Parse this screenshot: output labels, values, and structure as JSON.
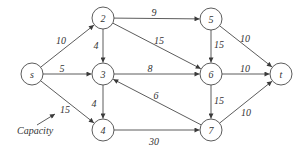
{
  "diagram": {
    "type": "flow-network",
    "colors": {
      "stroke": "#4a4a4a",
      "text": "#333333",
      "background": "#ffffff"
    },
    "node_radius": 11,
    "nodes": [
      {
        "id": "s",
        "label": "s",
        "x": 32,
        "y": 74
      },
      {
        "id": "2",
        "label": "2",
        "x": 103,
        "y": 18
      },
      {
        "id": "3",
        "label": "3",
        "x": 103,
        "y": 74
      },
      {
        "id": "4",
        "label": "4",
        "x": 103,
        "y": 130
      },
      {
        "id": "5",
        "label": "5",
        "x": 211,
        "y": 19
      },
      {
        "id": "6",
        "label": "6",
        "x": 211,
        "y": 74
      },
      {
        "id": "7",
        "label": "7",
        "x": 211,
        "y": 130
      },
      {
        "id": "t",
        "label": "t",
        "x": 281,
        "y": 74
      }
    ],
    "edges": [
      {
        "from": "s",
        "to": "2",
        "capacity": "10",
        "lx": 61,
        "ly": 40
      },
      {
        "from": "s",
        "to": "3",
        "capacity": "5",
        "lx": 62,
        "ly": 68
      },
      {
        "from": "s",
        "to": "4",
        "capacity": "15",
        "lx": 65,
        "ly": 109
      },
      {
        "from": "2",
        "to": "3",
        "capacity": "4",
        "lx": 96,
        "ly": 45
      },
      {
        "from": "2",
        "to": "5",
        "capacity": "9",
        "lx": 154,
        "ly": 12
      },
      {
        "from": "2",
        "to": "6",
        "capacity": "15",
        "lx": 159,
        "ly": 40
      },
      {
        "from": "3",
        "to": "4",
        "capacity": "4",
        "lx": 94,
        "ly": 103
      },
      {
        "from": "3",
        "to": "6",
        "capacity": "8",
        "lx": 150,
        "ly": 68
      },
      {
        "from": "4",
        "to": "7",
        "capacity": "30",
        "lx": 154,
        "ly": 141
      },
      {
        "from": "5",
        "to": "6",
        "capacity": "15",
        "lx": 219,
        "ly": 44
      },
      {
        "from": "5",
        "to": "t",
        "capacity": "10",
        "lx": 245,
        "ly": 38
      },
      {
        "from": "6",
        "to": "t",
        "capacity": "10",
        "lx": 245,
        "ly": 68
      },
      {
        "from": "6",
        "to": "7",
        "capacity": "15",
        "lx": 219,
        "ly": 100
      },
      {
        "from": "7",
        "to": "3",
        "capacity": "6",
        "lx": 156,
        "ly": 95
      },
      {
        "from": "7",
        "to": "t",
        "capacity": "10",
        "lx": 246,
        "ly": 112
      }
    ],
    "annotation": {
      "text": "Capacity",
      "x": 17,
      "y": 134,
      "arrow": {
        "x1": 37,
        "y1": 125,
        "x2": 55,
        "y2": 114
      }
    }
  }
}
